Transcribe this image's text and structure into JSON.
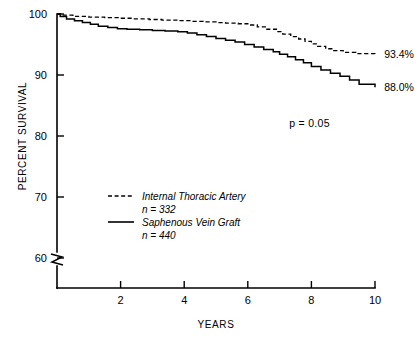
{
  "chart_data": {
    "type": "line",
    "title": "",
    "xlabel": "YEARS",
    "ylabel": "PERCENT SURVIVAL",
    "xlim": [
      0,
      10
    ],
    "ylim": [
      60,
      100
    ],
    "y_axis_break": true,
    "y_break_note": "axis broken below 60",
    "grid": false,
    "legend_position": "center-left",
    "xticks": [
      "2",
      "4",
      "6",
      "8",
      "10"
    ],
    "xtick_values": [
      2,
      4,
      6,
      8,
      10
    ],
    "yticks": [
      "100",
      "90",
      "80",
      "70",
      "60"
    ],
    "ytick_values": [
      100,
      90,
      80,
      70,
      60
    ],
    "annotations": [
      {
        "name": "p-value",
        "text": "p = 0.05",
        "x": 7.3,
        "y": 81.5
      },
      {
        "name": "ita-endpoint",
        "text": "93.4%",
        "x": 10.1,
        "y": 93.4
      },
      {
        "name": "svg-endpoint",
        "text": "88.0%",
        "x": 10.1,
        "y": 88.0
      }
    ],
    "series": [
      {
        "name": "Internal Thoracic Artery",
        "n_label": "n = 332",
        "n": 332,
        "style": "dashed",
        "color": "#000000",
        "end_value": 93.4,
        "x": [
          0.0,
          0.15,
          0.5,
          1.0,
          1.5,
          2.0,
          2.4,
          2.9,
          3.3,
          3.8,
          4.2,
          4.6,
          5.0,
          5.3,
          5.7,
          6.0,
          6.3,
          6.6,
          6.9,
          7.1,
          7.35,
          7.6,
          7.8,
          8.0,
          8.2,
          8.45,
          8.7,
          9.0,
          9.4,
          10.0
        ],
        "y": [
          100.0,
          99.8,
          99.6,
          99.5,
          99.4,
          99.3,
          99.2,
          99.1,
          99.0,
          98.9,
          98.8,
          98.7,
          98.6,
          98.5,
          98.4,
          98.2,
          97.9,
          97.5,
          97.1,
          96.7,
          96.3,
          95.9,
          95.5,
          95.1,
          94.7,
          94.3,
          94.0,
          93.7,
          93.5,
          93.4
        ]
      },
      {
        "name": "Saphenous Vein Graft",
        "n_label": "n = 440",
        "n": 440,
        "style": "solid",
        "color": "#000000",
        "end_value": 88.0,
        "x": [
          0.0,
          0.1,
          0.3,
          0.55,
          0.8,
          1.05,
          1.3,
          1.6,
          1.9,
          2.2,
          2.6,
          3.0,
          3.4,
          3.8,
          4.1,
          4.4,
          4.7,
          5.0,
          5.3,
          5.6,
          5.9,
          6.2,
          6.5,
          6.8,
          7.0,
          7.25,
          7.5,
          7.75,
          8.0,
          8.3,
          8.6,
          8.9,
          9.2,
          9.5,
          10.0
        ],
        "y": [
          100.0,
          99.6,
          99.2,
          98.9,
          98.6,
          98.3,
          98.0,
          97.8,
          97.6,
          97.5,
          97.4,
          97.3,
          97.2,
          97.1,
          96.9,
          96.6,
          96.3,
          96.0,
          95.7,
          95.4,
          95.0,
          94.6,
          94.2,
          93.8,
          93.4,
          93.0,
          92.5,
          92.0,
          91.4,
          90.8,
          90.3,
          89.8,
          89.2,
          88.5,
          88.0
        ]
      }
    ]
  }
}
